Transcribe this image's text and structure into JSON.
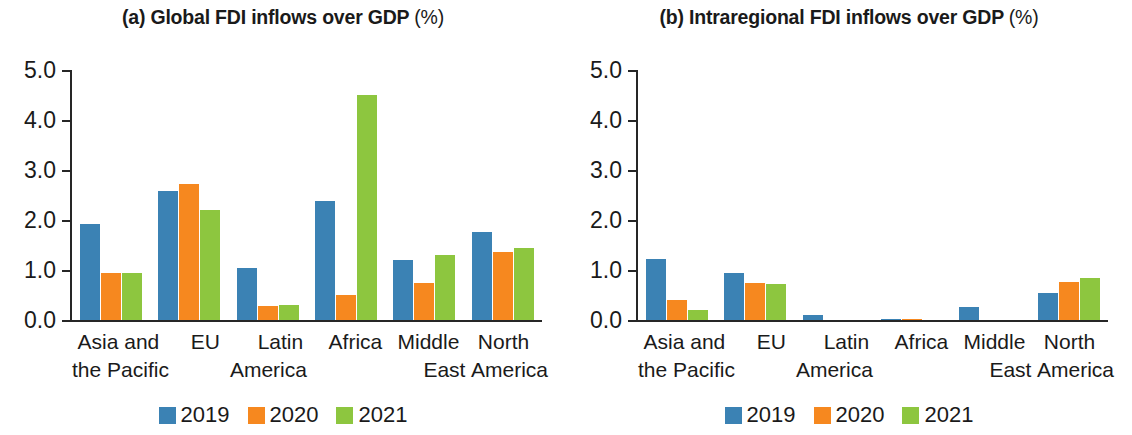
{
  "figure": {
    "panels": [
      {
        "id": "a",
        "title_main": "(a) Global FDI inflows over GDP",
        "title_suffix": "(%)"
      },
      {
        "id": "b",
        "title_main": "(b) Intraregional FDI inflows over GDP",
        "title_suffix": "(%)"
      }
    ],
    "legend": {
      "items": [
        {
          "label": "2019",
          "color": "#3b82b4"
        },
        {
          "label": "2020",
          "color": "#f6881f"
        },
        {
          "label": "2021",
          "color": "#8dc63f"
        }
      ]
    },
    "category_labels": [
      {
        "line1": "Asia and",
        "line2": "the Pacific"
      },
      {
        "line1": "EU",
        "line2": ""
      },
      {
        "line1": "Latin",
        "line2": "America"
      },
      {
        "line1": "Africa",
        "line2": ""
      },
      {
        "line1": "Middle",
        "line2": "East"
      },
      {
        "line1": "North",
        "line2": "America"
      }
    ],
    "y_tick_labels": [
      "5.0",
      "4.0",
      "3.0",
      "2.0",
      "1.0",
      "0.0"
    ]
  },
  "chart_data": [
    {
      "type": "bar",
      "title": "(a) Global FDI inflows over GDP (%)",
      "xlabel": "",
      "ylabel": "",
      "ylim": [
        0,
        5
      ],
      "yticks": [
        0,
        1,
        2,
        3,
        4,
        5
      ],
      "grid": false,
      "legend_position": "bottom",
      "categories": [
        "Asia and the Pacific",
        "EU",
        "Latin America",
        "Africa",
        "Middle East",
        "North America"
      ],
      "series": [
        {
          "name": "2019",
          "color": "#3b82b4",
          "values": [
            1.93,
            2.58,
            1.04,
            2.38,
            1.2,
            1.77
          ]
        },
        {
          "name": "2020",
          "color": "#f6881f",
          "values": [
            0.95,
            2.72,
            0.28,
            0.5,
            0.75,
            1.36
          ]
        },
        {
          "name": "2021",
          "color": "#8dc63f",
          "values": [
            0.95,
            2.2,
            0.3,
            4.5,
            1.31,
            1.44
          ]
        }
      ]
    },
    {
      "type": "bar",
      "title": "(b) Intraregional FDI inflows over GDP (%)",
      "xlabel": "",
      "ylabel": "",
      "ylim": [
        0,
        5
      ],
      "yticks": [
        0,
        1,
        2,
        3,
        4,
        5
      ],
      "grid": false,
      "legend_position": "bottom",
      "categories": [
        "Asia and the Pacific",
        "EU",
        "Latin America",
        "Africa",
        "Middle East",
        "North America"
      ],
      "series": [
        {
          "name": "2019",
          "color": "#3b82b4",
          "values": [
            1.22,
            0.95,
            0.1,
            0.03,
            0.27,
            0.55
          ]
        },
        {
          "name": "2020",
          "color": "#f6881f",
          "values": [
            0.41,
            0.74,
            0.0,
            0.03,
            0.0,
            0.77
          ]
        },
        {
          "name": "2021",
          "color": "#8dc63f",
          "values": [
            0.2,
            0.72,
            0.0,
            0.0,
            0.0,
            0.84
          ]
        }
      ]
    }
  ]
}
